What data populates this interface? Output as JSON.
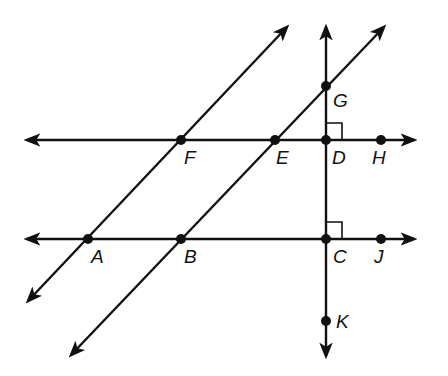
{
  "diagram": {
    "type": "geometry",
    "stroke_color": "#111111",
    "background": "#ffffff",
    "lines": [
      {
        "id": "line-FH",
        "through": [
          "F",
          "E",
          "D",
          "H"
        ],
        "orientation": "horizontal",
        "arrows": "both"
      },
      {
        "id": "line-AJ",
        "through": [
          "A",
          "B",
          "C",
          "J"
        ],
        "orientation": "horizontal",
        "arrows": "both"
      },
      {
        "id": "line-AF",
        "through": [
          "A",
          "F"
        ],
        "orientation": "diagonal",
        "arrows": "both"
      },
      {
        "id": "line-BG",
        "through": [
          "B",
          "E",
          "G"
        ],
        "orientation": "diagonal",
        "arrows": "both"
      },
      {
        "id": "line-GK",
        "through": [
          "G",
          "D",
          "C",
          "K"
        ],
        "orientation": "vertical",
        "arrows": "both"
      }
    ],
    "right_angles": [
      "D",
      "C"
    ],
    "points": {
      "A": {
        "label": "A",
        "x": 88,
        "y": 239
      },
      "B": {
        "label": "B",
        "x": 181,
        "y": 239
      },
      "C": {
        "label": "C",
        "x": 326,
        "y": 239
      },
      "D": {
        "label": "D",
        "x": 326,
        "y": 140
      },
      "E": {
        "label": "E",
        "x": 275,
        "y": 140
      },
      "F": {
        "label": "F",
        "x": 181,
        "y": 140
      },
      "G": {
        "label": "G",
        "x": 326,
        "y": 86
      },
      "H": {
        "label": "H",
        "x": 381,
        "y": 140
      },
      "J": {
        "label": "J",
        "x": 381,
        "y": 239
      },
      "K": {
        "label": "K",
        "x": 326,
        "y": 321
      }
    }
  }
}
